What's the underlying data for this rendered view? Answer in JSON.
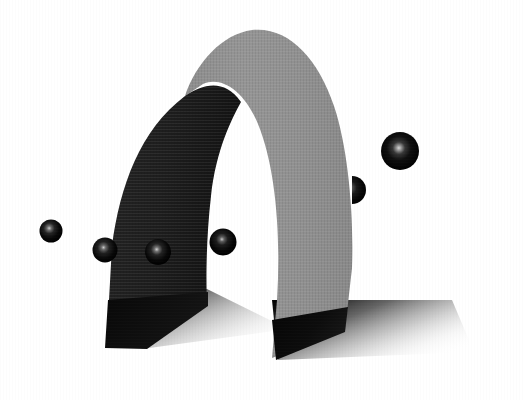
{
  "scene": {
    "title": "3D Arch Render",
    "width": 525,
    "height": 400,
    "background_color": "#ffffff",
    "description": "Grayscale 3D rendering of a curved ribbon arch standing on a ground plane with cast shadows and six dark specular spheres"
  },
  "arch": {
    "name": "curved-ribbon-arch",
    "outer_surface_label": "outer-surface",
    "outer_color": "#919191",
    "outer_color_light": "#9a9a9a",
    "outer_color_dark": "#868686",
    "inner_surface_label": "inner-surface",
    "inner_color": "#1f1f1f",
    "inner_color_dark": "#161616",
    "inner_color_light": "#2c2c2c",
    "apex_x": 245,
    "apex_y": 30,
    "left_foot_x": 105,
    "left_foot_y": 348,
    "right_foot_x": 272,
    "right_foot_y": 358
  },
  "ground": {
    "name": "ground-plane",
    "color": "#ffffff"
  },
  "shadows": [
    {
      "id": "left-shadow",
      "label": "left-leg-cast-shadow",
      "near_color": "#2a2a2a",
      "far_color": "#ffffff"
    },
    {
      "id": "right-shadow",
      "label": "right-leg-cast-shadow",
      "near_color": "#101010",
      "far_color": "#ffffff"
    }
  ],
  "spheres": [
    {
      "id": "sphere-1",
      "label": "sphere-far-left",
      "cx": 51,
      "cy": 231,
      "r": 11.5,
      "body_color": "#070707",
      "highlight_color": "#cfcfcf",
      "occluded": false
    },
    {
      "id": "sphere-2",
      "label": "sphere-left-on-leg",
      "cx": 105,
      "cy": 250,
      "r": 12.5,
      "body_color": "#0a0a0a",
      "highlight_color": "#c8c8c8",
      "occluded": false
    },
    {
      "id": "sphere-3",
      "label": "sphere-center-on-leg",
      "cx": 158,
      "cy": 252,
      "r": 13.0,
      "body_color": "#0a0a0a",
      "highlight_color": "#d2d2d2",
      "occluded": false
    },
    {
      "id": "sphere-4",
      "label": "sphere-in-archway",
      "cx": 223,
      "cy": 242,
      "r": 13.5,
      "body_color": "#050505",
      "highlight_color": "#c6c6c6",
      "occluded": false
    },
    {
      "id": "sphere-5",
      "label": "sphere-behind-right-leg",
      "cx": 352,
      "cy": 190,
      "r": 14.0,
      "body_color": "#070707",
      "highlight_color": "#9a9a9a",
      "occluded": true
    },
    {
      "id": "sphere-6",
      "label": "sphere-upper-right",
      "cx": 400,
      "cy": 151,
      "r": 19.0,
      "body_color": "#060606",
      "highlight_color": "#d8d8d8",
      "occluded": false
    }
  ],
  "chart_data": {
    "type": "scatter",
    "xlabel": "",
    "ylabel": "",
    "categories": [
      "sphere-far-left",
      "sphere-left-on-leg",
      "sphere-center-on-leg",
      "sphere-in-archway",
      "sphere-behind-right-leg",
      "sphere-upper-right"
    ],
    "x": [
      51,
      105,
      158,
      223,
      352,
      400
    ],
    "y": [
      231,
      250,
      252,
      242,
      190,
      151
    ],
    "values": [
      11.5,
      12.5,
      13.0,
      13.5,
      14.0,
      19.0
    ],
    "xlim": [
      0,
      525
    ],
    "ylim": [
      0,
      400
    ]
  }
}
